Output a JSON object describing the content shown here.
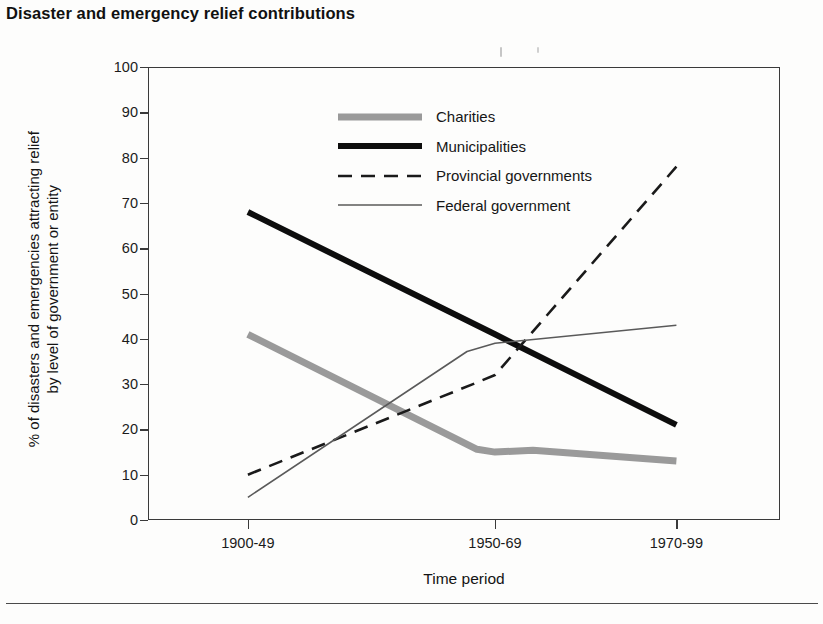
{
  "title": "Disaster and emergency relief contributions",
  "axis": {
    "x_title": "Time period",
    "y_title_line1": "% of disasters and emergencies attracting relief",
    "y_title_line2": "by level of government or entity"
  },
  "legend": [
    {
      "label": "Charities",
      "style": "thick-gray",
      "color": "#9a9a9a"
    },
    {
      "label": "Municipalities",
      "style": "thick-black",
      "color": "#0d0d0d"
    },
    {
      "label": "Provincial governments",
      "style": "dashed-black",
      "color": "#1a1a1a"
    },
    {
      "label": "Federal government",
      "style": "thin-gray",
      "color": "#5a5a5a"
    }
  ],
  "chart_data": {
    "type": "line",
    "title": "Disaster and emergency relief contributions",
    "xlabel": "Time period",
    "ylabel": "% of disasters and emergencies attracting relief by level of government or entity",
    "categories": [
      "1900-49",
      "1950-69",
      "1970-99"
    ],
    "ylim": [
      0,
      100
    ],
    "yticks": [
      0,
      10,
      20,
      30,
      40,
      50,
      60,
      70,
      80,
      90,
      100
    ],
    "grid": false,
    "legend_position": "upper-center",
    "series": [
      {
        "name": "Charities",
        "values": [
          41,
          15,
          13
        ],
        "color": "#9a9a9a",
        "width": 7,
        "dash": "none"
      },
      {
        "name": "Municipalities",
        "values": [
          68,
          41,
          21
        ],
        "color": "#0d0d0d",
        "width": 6,
        "dash": "none"
      },
      {
        "name": "Provincial governments",
        "values": [
          10,
          32,
          78
        ],
        "color": "#1a1a1a",
        "width": 2.6,
        "dash": "14,9"
      },
      {
        "name": "Federal government",
        "values": [
          5,
          39,
          43
        ],
        "color": "#5a5a5a",
        "width": 1.6,
        "dash": "none"
      }
    ]
  }
}
